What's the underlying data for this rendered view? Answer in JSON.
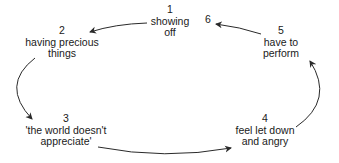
{
  "diagram": {
    "type": "cycle",
    "nodes": [
      {
        "id": "1",
        "number": "1",
        "lines": [
          "showing",
          "off"
        ],
        "x": 170,
        "y": 4
      },
      {
        "id": "2",
        "number": "2",
        "lines": [
          "having precious",
          "things"
        ],
        "x": 62,
        "y": 25
      },
      {
        "id": "3",
        "number": "3",
        "lines": [
          "'the world doesn't",
          "appreciate'"
        ],
        "x": 66,
        "y": 113
      },
      {
        "id": "4",
        "number": "4",
        "lines": [
          "feel let down",
          "and angry"
        ],
        "x": 265,
        "y": 113
      },
      {
        "id": "5",
        "number": "5",
        "lines": [
          "have to",
          "perform"
        ],
        "x": 281,
        "y": 25
      },
      {
        "id": "6",
        "number": "6",
        "lines": [],
        "x": 208,
        "y": 14
      }
    ],
    "edges": [
      {
        "from": "1",
        "to": "2"
      },
      {
        "from": "2",
        "to": "3"
      },
      {
        "from": "3",
        "to": "4"
      },
      {
        "from": "4",
        "to": "5"
      },
      {
        "from": "5",
        "to": "6"
      }
    ],
    "colors": {
      "text": "#1a1a1a",
      "arrow": "#2a2a2a",
      "background": "#ffffff"
    }
  }
}
